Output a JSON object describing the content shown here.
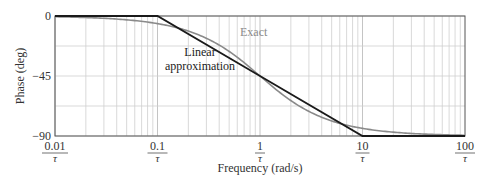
{
  "chart_data": {
    "type": "line",
    "title": "",
    "xlabel": "Frequency (rad/s)",
    "ylabel": "Phase (deg)",
    "xscale": "log",
    "xlim": [
      0.01,
      100
    ],
    "ylim": [
      -90,
      0
    ],
    "grid": true,
    "x_ticks": [
      {
        "value": 0.01,
        "numerator": "0.01",
        "denominator": "τ"
      },
      {
        "value": 0.1,
        "numerator": "0.1",
        "denominator": "τ"
      },
      {
        "value": 1,
        "numerator": "1",
        "denominator": "τ"
      },
      {
        "value": 10,
        "numerator": "10",
        "denominator": "τ"
      },
      {
        "value": 100,
        "numerator": "100",
        "denominator": "τ"
      }
    ],
    "y_ticks": [
      {
        "value": 0,
        "label": "0"
      },
      {
        "value": -45,
        "label": "−45"
      },
      {
        "value": -90,
        "label": "−90"
      }
    ],
    "series": [
      {
        "name": "Exact",
        "color": "#8a8a8a",
        "x": [
          0.01,
          0.02,
          0.05,
          0.1,
          0.2,
          0.3,
          0.5,
          0.7,
          1,
          1.5,
          2,
          3,
          5,
          10,
          20,
          50,
          100
        ],
        "values": [
          -0.6,
          -1.1,
          -2.9,
          -5.7,
          -11.3,
          -16.7,
          -26.6,
          -35.0,
          -45.0,
          -56.3,
          -63.4,
          -71.6,
          -78.7,
          -84.3,
          -87.1,
          -88.9,
          -89.4
        ]
      },
      {
        "name": "Linear approximation",
        "color": "#1a1a1a",
        "x": [
          0.01,
          0.1,
          1,
          10,
          100
        ],
        "values": [
          0,
          0,
          -45,
          -90,
          -90
        ]
      }
    ],
    "annotations": [
      {
        "text": "Exact",
        "color": "#8a8a8a"
      },
      {
        "text": "Linear approximation",
        "lines": [
          "Linear",
          "approximation"
        ],
        "color": "#1a1a1a"
      }
    ]
  },
  "labels": {
    "ylabel": "Phase (deg)",
    "xlabel": "Frequency (rad/s)",
    "exact": "Exact",
    "linear_line1": "Linear",
    "linear_line2": "approximation"
  }
}
